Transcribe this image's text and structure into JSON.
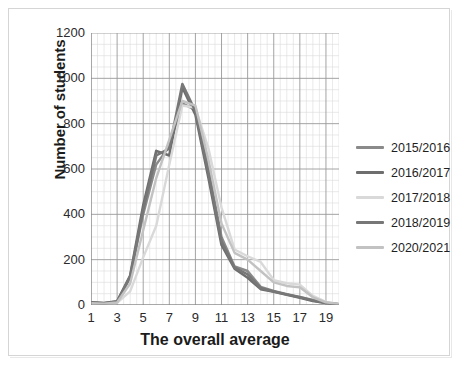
{
  "chart_data": {
    "type": "line",
    "title": "",
    "xlabel": "The overall average",
    "ylabel": "Number of students",
    "xlim": [
      1,
      20
    ],
    "ylim": [
      0,
      1200
    ],
    "grid": true,
    "legend_position": "right",
    "x_ticks": [
      "1",
      "3",
      "5",
      "7",
      "9",
      "11",
      "13",
      "15",
      "17",
      "19"
    ],
    "y_ticks": [
      "0",
      "200",
      "400",
      "600",
      "800",
      "1000",
      "1200"
    ],
    "x": [
      1,
      2,
      3,
      4,
      5,
      6,
      7,
      8,
      9,
      10,
      11,
      12,
      13,
      14,
      15,
      16,
      17,
      18,
      19,
      20
    ],
    "series": [
      {
        "name": "2015/2016",
        "color": "#8a8a8a",
        "width": 2.4,
        "values": [
          10,
          8,
          14,
          120,
          400,
          620,
          700,
          890,
          860,
          600,
          300,
          170,
          150,
          80,
          62,
          48,
          36,
          22,
          10,
          4
        ]
      },
      {
        "name": "2016/2017",
        "color": "#6e6e6e",
        "width": 2.6,
        "values": [
          12,
          9,
          16,
          130,
          440,
          680,
          660,
          960,
          840,
          560,
          265,
          160,
          120,
          70,
          58,
          45,
          32,
          18,
          9,
          3
        ]
      },
      {
        "name": "2017/2018",
        "color": "#d9d9d9",
        "width": 2.4,
        "values": [
          6,
          5,
          9,
          60,
          210,
          350,
          620,
          880,
          870,
          690,
          430,
          245,
          215,
          190,
          110,
          96,
          90,
          40,
          14,
          5
        ]
      },
      {
        "name": "2018/2019",
        "color": "#777777",
        "width": 2.6,
        "values": [
          11,
          8,
          15,
          125,
          420,
          660,
          690,
          975,
          855,
          580,
          280,
          165,
          135,
          75,
          60,
          46,
          34,
          20,
          9,
          3
        ]
      },
      {
        "name": "2020/2021",
        "color": "#c2c2c2",
        "width": 2.4,
        "values": [
          8,
          6,
          11,
          95,
          330,
          560,
          730,
          900,
          880,
          640,
          360,
          230,
          200,
          150,
          100,
          84,
          78,
          34,
          12,
          4
        ]
      }
    ]
  },
  "axis": {
    "y_title": "Number of students",
    "x_title": "The overall average"
  },
  "legend": {
    "entries": [
      {
        "label": "2015/2016"
      },
      {
        "label": "2016/2017"
      },
      {
        "label": "2017/2018"
      },
      {
        "label": "2018/2019"
      },
      {
        "label": "2020/2021"
      }
    ]
  },
  "colors": {
    "major_grid": "#9a9a9a",
    "minor_grid": "#dcdcdc",
    "axis_line": "#808080",
    "frame": "#d5d5d5",
    "text": "#1b1b1b"
  }
}
